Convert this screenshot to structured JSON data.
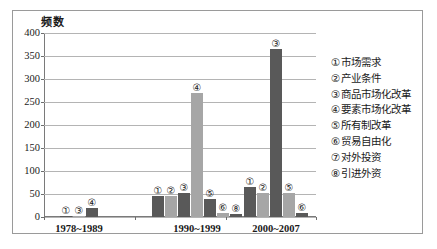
{
  "chart_data": {
    "type": "bar",
    "title": "",
    "ylabel": "频数",
    "xlabel": "",
    "ylim": [
      0,
      400
    ],
    "yticks": [
      0,
      50,
      100,
      150,
      200,
      250,
      300,
      350,
      400
    ],
    "grid": true,
    "legend_position": "right",
    "categories": [
      "1978~1989",
      "1990~1999",
      "2000~2007"
    ],
    "groups": [
      {
        "category": "1978~1989",
        "bars": [
          {
            "label": "①",
            "value": 2
          },
          {
            "label": "③",
            "value": 3
          },
          {
            "label": "④",
            "value": 20
          }
        ]
      },
      {
        "category": "1990~1999",
        "bars": [
          {
            "label": "①",
            "value": 45
          },
          {
            "label": "②",
            "value": 45
          },
          {
            "label": "③",
            "value": 52
          },
          {
            "label": "④",
            "value": 270
          },
          {
            "label": "⑤",
            "value": 40
          },
          {
            "label": "⑥",
            "value": 8
          },
          {
            "label": "⑧",
            "value": 7
          }
        ]
      },
      {
        "category": "2000~2007",
        "bars": [
          {
            "label": "①",
            "value": 65
          },
          {
            "label": "②",
            "value": 52
          },
          {
            "label": "③",
            "value": 365
          },
          {
            "label": "⑤",
            "value": 52
          },
          {
            "label": "⑥",
            "value": 8
          }
        ]
      }
    ],
    "legend": [
      {
        "marker": "①",
        "label": "市场需求"
      },
      {
        "marker": "②",
        "label": "产业条件"
      },
      {
        "marker": "③",
        "label": "商品市场化改革"
      },
      {
        "marker": "④",
        "label": "要素市场化改革"
      },
      {
        "marker": "⑤",
        "label": "所有制改革"
      },
      {
        "marker": "⑥",
        "label": "贸易自由化"
      },
      {
        "marker": "⑦",
        "label": "对外投资"
      },
      {
        "marker": "⑧",
        "label": "引进外资"
      }
    ],
    "colors": {
      "bar_dark": "#595959",
      "bar_light": "#a6a6a6",
      "gridline": "#b4b4b4",
      "axis": "#7a7a7a",
      "frame": "#9a9a9a",
      "text": "#1a1a1a"
    }
  }
}
